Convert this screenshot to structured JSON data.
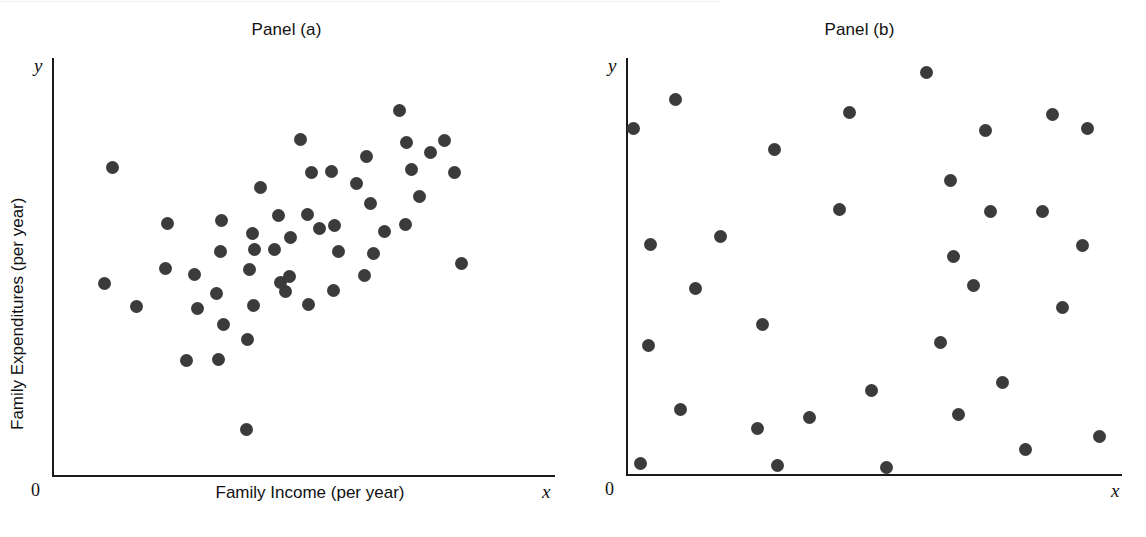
{
  "figure": {
    "width": 1146,
    "height": 537,
    "background": "#ffffff",
    "dot_color": "#3b3b3b",
    "axis_color": "#1a1a1a"
  },
  "panels": {
    "a": {
      "title": "Panel (a)",
      "x_axis_label": "Family Income (per year)",
      "y_axis_label": "Family Expenditures (per year)",
      "x_axis_letter": "x",
      "y_axis_letter": "y",
      "origin_label": "0"
    },
    "b": {
      "title": "Panel (b)",
      "x_axis_label": "",
      "y_axis_label": "",
      "x_axis_letter": "x",
      "y_axis_letter": "y",
      "origin_label": "0"
    }
  },
  "chart_data": [
    {
      "type": "scatter",
      "title": "Panel (a)",
      "xlabel": "Family Income (per year)",
      "ylabel": "Family Expenditures (per year)",
      "xlim": [
        0,
        100
      ],
      "ylim": [
        0,
        100
      ],
      "grid": false,
      "legend": "none",
      "annotations": [
        "0",
        "x",
        "y"
      ],
      "relationship": "positive linear association",
      "n_points": 50,
      "points": [
        [
          12.0,
          73.8
        ],
        [
          10.5,
          46.0
        ],
        [
          16.8,
          40.3
        ],
        [
          23.0,
          60.2
        ],
        [
          22.5,
          49.5
        ],
        [
          28.4,
          48.0
        ],
        [
          29.0,
          40.0
        ],
        [
          26.8,
          27.5
        ],
        [
          33.6,
          61.0
        ],
        [
          33.5,
          53.5
        ],
        [
          32.8,
          43.5
        ],
        [
          34.0,
          36.2
        ],
        [
          33.2,
          27.8
        ],
        [
          41.4,
          69.0
        ],
        [
          39.8,
          58.0
        ],
        [
          40.2,
          54.0
        ],
        [
          39.3,
          49.4
        ],
        [
          40.0,
          40.6
        ],
        [
          38.9,
          32.5
        ],
        [
          44.2,
          54.0
        ],
        [
          45.5,
          46.1
        ],
        [
          45.0,
          62.2
        ],
        [
          47.4,
          57.0
        ],
        [
          47.2,
          47.5
        ],
        [
          46.5,
          44.0
        ],
        [
          49.4,
          80.5
        ],
        [
          51.5,
          72.5
        ],
        [
          50.7,
          62.5
        ],
        [
          51.0,
          41.0
        ],
        [
          53.1,
          59.0
        ],
        [
          55.6,
          72.8
        ],
        [
          56.2,
          59.8
        ],
        [
          57.0,
          53.5
        ],
        [
          56.0,
          44.2
        ],
        [
          60.5,
          70.0
        ],
        [
          62.6,
          76.4
        ],
        [
          63.4,
          65.2
        ],
        [
          64.0,
          53.0
        ],
        [
          62.2,
          47.8
        ],
        [
          66.2,
          58.3
        ],
        [
          69.0,
          87.4
        ],
        [
          70.4,
          79.8
        ],
        [
          71.4,
          73.2
        ],
        [
          73.0,
          66.8
        ],
        [
          70.2,
          60.0
        ],
        [
          75.3,
          77.4
        ],
        [
          78.0,
          80.2
        ],
        [
          80.0,
          72.5
        ],
        [
          81.5,
          50.6
        ],
        [
          38.6,
          11.0
        ]
      ]
    },
    {
      "type": "scatter",
      "title": "Panel (b)",
      "xlabel": "",
      "ylabel": "",
      "xlim": [
        0,
        100
      ],
      "ylim": [
        0,
        100
      ],
      "grid": false,
      "legend": "none",
      "annotations": [
        "0",
        "x",
        "y"
      ],
      "relationship": "no association (random scatter)",
      "n_points": 33,
      "points": [
        [
          1.5,
          83.0
        ],
        [
          10.0,
          90.0
        ],
        [
          5.0,
          55.2
        ],
        [
          14.0,
          44.5
        ],
        [
          4.5,
          31.0
        ],
        [
          11.0,
          15.5
        ],
        [
          3.0,
          2.5
        ],
        [
          30.0,
          78.0
        ],
        [
          27.5,
          36.0
        ],
        [
          26.5,
          11.0
        ],
        [
          19.0,
          57.0
        ],
        [
          37.0,
          13.5
        ],
        [
          30.5,
          2.0
        ],
        [
          45.0,
          87.0
        ],
        [
          43.0,
          63.5
        ],
        [
          49.5,
          20.0
        ],
        [
          52.5,
          1.5
        ],
        [
          60.5,
          96.5
        ],
        [
          65.5,
          70.5
        ],
        [
          66.0,
          52.2
        ],
        [
          63.5,
          31.5
        ],
        [
          67.0,
          14.3
        ],
        [
          72.5,
          82.5
        ],
        [
          73.5,
          63.0
        ],
        [
          70.0,
          45.2
        ],
        [
          76.0,
          22.0
        ],
        [
          80.5,
          6.0
        ],
        [
          86.0,
          86.5
        ],
        [
          88.0,
          40.0
        ],
        [
          84.0,
          63.0
        ],
        [
          93.0,
          83.0
        ],
        [
          92.0,
          55.0
        ],
        [
          95.5,
          9.0
        ]
      ]
    }
  ]
}
